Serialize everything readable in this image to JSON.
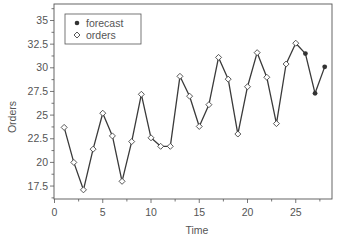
{
  "chart_data": {
    "type": "line",
    "title": "",
    "xlabel": "Time",
    "ylabel": "Orders",
    "xlim": [
      0,
      28.8
    ],
    "ylim": [
      16.1,
      36.7
    ],
    "x_ticks": [
      0,
      5,
      10,
      15,
      20,
      25
    ],
    "x_tick_labels": [
      "0",
      "5",
      "10",
      "15",
      "20",
      "25"
    ],
    "y_ticks": [
      17.5,
      20,
      22.5,
      25,
      27.5,
      30,
      32.5,
      35
    ],
    "y_tick_labels": [
      "17.5",
      "20",
      "22.5",
      "25",
      "27.5",
      "30",
      "32.5",
      "35"
    ],
    "grid": false,
    "legend_position": "upper left",
    "legend": [
      {
        "label": "forecast",
        "marker": "filled-circle"
      },
      {
        "label": "orders",
        "marker": "hollow-diamond"
      }
    ],
    "series": [
      {
        "name": "orders",
        "marker": "hollow-diamond",
        "x": [
          1,
          2,
          3,
          4,
          5,
          6,
          7,
          8,
          9,
          10,
          11,
          12,
          13,
          14,
          15,
          16,
          17,
          18,
          19,
          20,
          21,
          22,
          23,
          24,
          25
        ],
        "values": [
          23.7,
          20.0,
          17.1,
          21.4,
          25.2,
          22.8,
          18.0,
          22.2,
          27.2,
          22.6,
          21.7,
          21.7,
          29.1,
          27.0,
          23.8,
          26.1,
          31.1,
          28.8,
          23.0,
          28.0,
          31.6,
          29.0,
          24.1,
          30.4,
          32.6
        ]
      },
      {
        "name": "forecast",
        "marker": "filled-circle",
        "x": [
          26,
          27,
          28
        ],
        "values": [
          31.5,
          27.3,
          30.1
        ]
      }
    ]
  },
  "colors": {
    "line": "#3a3a3a",
    "axis": "#555555",
    "text": "#555555"
  }
}
